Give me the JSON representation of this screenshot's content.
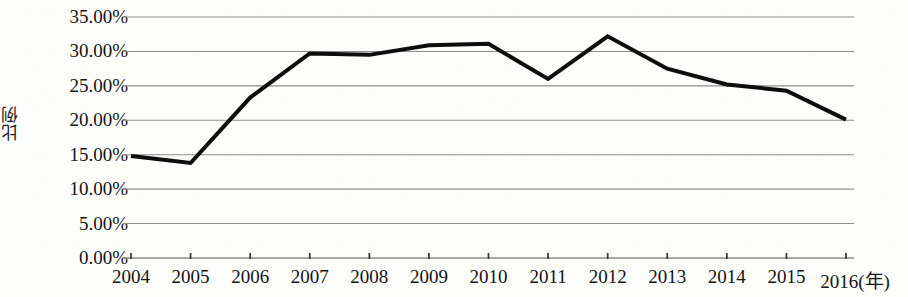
{
  "chart_data": {
    "type": "line",
    "title": "",
    "subtitle": "",
    "xlabel": "(年)",
    "ylabel": "比例",
    "categories": [
      "2004",
      "2005",
      "2006",
      "2007",
      "2008",
      "2009",
      "2010",
      "2011",
      "2012",
      "2013",
      "2014",
      "2015",
      "2016"
    ],
    "values": [
      14.8,
      13.8,
      23.3,
      29.7,
      29.5,
      30.9,
      31.1,
      26.0,
      32.2,
      27.5,
      25.2,
      24.3,
      20.1
    ],
    "series": [
      {
        "name": "比例",
        "values": [
          14.8,
          13.8,
          23.3,
          29.7,
          29.5,
          30.9,
          31.1,
          26.0,
          32.2,
          27.5,
          25.2,
          24.3,
          20.1
        ]
      }
    ],
    "ylim": [
      0,
      35
    ],
    "ytick_values": [
      0,
      5,
      10,
      15,
      20,
      25,
      30,
      35
    ],
    "ytick_labels": [
      "0.00%",
      "5.00%",
      "10.00%",
      "15.00%",
      "20.00%",
      "25.00%",
      "30.00%",
      "35.00%"
    ],
    "xtick_labels": [
      "2004",
      "2005",
      "2006",
      "2007",
      "2008",
      "2009",
      "2010",
      "2011",
      "2012",
      "2013",
      "2014",
      "2015",
      "2016(年)"
    ],
    "grid": "horizontal",
    "legend": "none",
    "line_color": "#0d0d0d",
    "line_width": 4,
    "grid_color": "#8d8d8d",
    "axis_color": "#6e6e6e",
    "background_color": "#fdfdfb",
    "annotations": []
  },
  "axis": {
    "y_title": "比例",
    "x_unit_label": "(年)"
  }
}
